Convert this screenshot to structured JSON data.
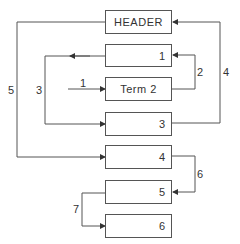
{
  "diagram": {
    "boxes": [
      {
        "id": "header",
        "label": "HEADER"
      },
      {
        "id": "box1",
        "label": "1"
      },
      {
        "id": "term2",
        "label": "Term 2"
      },
      {
        "id": "box3",
        "label": "3"
      },
      {
        "id": "box4",
        "label": "4"
      },
      {
        "id": "box5",
        "label": "5"
      },
      {
        "id": "box6",
        "label": "6"
      }
    ],
    "connectors": [
      {
        "id": "c1",
        "label": "1",
        "from": "external",
        "to": "term2"
      },
      {
        "id": "c2",
        "label": "2",
        "from": "term2",
        "to": "box1"
      },
      {
        "id": "c3",
        "label": "3",
        "from": "box1",
        "to": "box3"
      },
      {
        "id": "c4",
        "label": "4",
        "from": "box3",
        "to": "header"
      },
      {
        "id": "c5",
        "label": "5",
        "from": "header",
        "to": "box4"
      },
      {
        "id": "c6",
        "label": "6",
        "from": "box4",
        "to": "box5"
      },
      {
        "id": "c7",
        "label": "7",
        "from": "box5",
        "to": "box6"
      }
    ],
    "colors": {
      "line": "#555555",
      "text": "#333333",
      "background": "#ffffff"
    }
  }
}
